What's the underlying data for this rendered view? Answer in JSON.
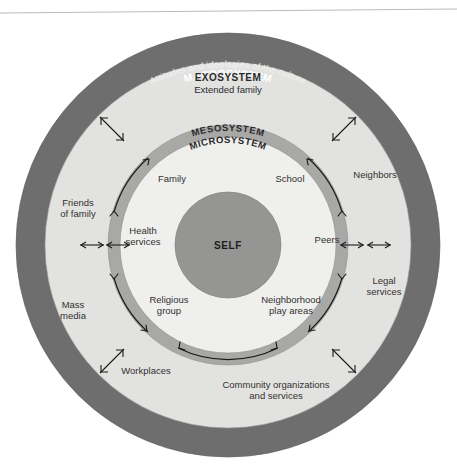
{
  "diagram": {
    "center_label": "SELF",
    "rings": [
      {
        "id": "macrosystem",
        "name": "MACROSYSTEM",
        "subtitle": "Attitudes and ideologies of the culture",
        "color": "#6e6e6e",
        "text_color": "#ffffff"
      },
      {
        "id": "exosystem",
        "name": "EXOSYSTEM",
        "subtitle": "Extended family",
        "color": "#e2e2e0",
        "text_color": "#2b2b2b"
      },
      {
        "id": "mesosystem",
        "name": "MESOSYSTEM",
        "subtitle": "",
        "color": "#a8a8a6",
        "text_color": "#2b2b2b"
      },
      {
        "id": "microsystem",
        "name": "MICROSYSTEM",
        "subtitle": "",
        "color": "#efefed",
        "text_color": "#2b2b2b"
      }
    ],
    "center": {
      "label": "SELF",
      "color": "#959593"
    },
    "microsystem_nodes": [
      {
        "id": "family",
        "label": "Family"
      },
      {
        "id": "school",
        "label": "School"
      },
      {
        "id": "health-services",
        "label": "Health\nservices",
        "line1": "Health",
        "line2": "services"
      },
      {
        "id": "peers",
        "label": "Peers"
      },
      {
        "id": "religious-group",
        "label": "Religious\ngroup",
        "line1": "Religious",
        "line2": "group"
      },
      {
        "id": "neighborhood-play-areas",
        "label": "Neighborhood\nplay areas",
        "line1": "Neighborhood",
        "line2": "play areas"
      }
    ],
    "exosystem_nodes": [
      {
        "id": "neighbors",
        "label": "Neighbors",
        "line1": "Neighbors",
        "line2": ""
      },
      {
        "id": "friends-of-family",
        "label": "Friends\nof family",
        "line1": "Friends",
        "line2": "of family"
      },
      {
        "id": "legal-services",
        "label": "Legal\nservices",
        "line1": "Legal",
        "line2": "services"
      },
      {
        "id": "mass-media",
        "label": "Mass\nmedia",
        "line1": "Mass",
        "line2": "media"
      },
      {
        "id": "workplaces",
        "label": "Workplaces",
        "line1": "Workplaces",
        "line2": ""
      },
      {
        "id": "community-organizations",
        "label": "Community organizations\nand services",
        "line1": "Community organizations",
        "line2": "and services"
      }
    ]
  }
}
